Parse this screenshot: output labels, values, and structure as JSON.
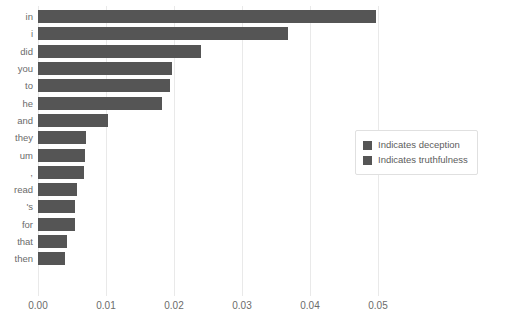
{
  "chart_data": {
    "type": "bar",
    "orientation": "horizontal",
    "title": "",
    "xlabel": "",
    "ylabel": "",
    "categories": [
      "in",
      "i",
      "did",
      "you",
      "to",
      "he",
      "and",
      "they",
      "um",
      ",",
      "read",
      "'s",
      "for",
      "that",
      "then"
    ],
    "values": [
      0.0497,
      0.0367,
      0.024,
      0.0197,
      0.0194,
      0.0182,
      0.0103,
      0.007,
      0.0069,
      0.0067,
      0.0057,
      0.0055,
      0.0055,
      0.0042,
      0.004
    ],
    "series": [
      {
        "name": "Indicates deception",
        "values": [
          0.0497,
          0.0367,
          0.024,
          0.0197,
          0.0194,
          0.0182,
          0.0103,
          0.007,
          0.0069,
          0.0067,
          0.0057,
          0.0055,
          0.0055,
          0.0042,
          0.004
        ]
      }
    ],
    "xlim": [
      0.0,
      0.05
    ],
    "xticks": [
      0.0,
      0.01,
      0.02,
      0.03,
      0.04,
      0.05
    ],
    "xticklabels": [
      "0.00",
      "0.01",
      "0.02",
      "0.03",
      "0.04",
      "0.05"
    ],
    "grid": "vertical",
    "legend_position": "right-middle",
    "legend": [
      {
        "label": "Indicates deception",
        "color": "#555555"
      },
      {
        "label": "Indicates truthfulness",
        "color": "#555555"
      }
    ],
    "colors": {
      "bar": "#555555",
      "gridline": "#e9e9e9",
      "tick_text": "#6b6b6b",
      "legend_text": "#5d5d5d",
      "legend_border": "#e0e0e0",
      "background": "#ffffff"
    }
  }
}
